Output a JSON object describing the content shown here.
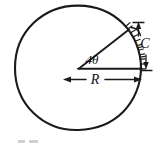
{
  "figure": {
    "kind": "hand-drawn-geometry-diagram",
    "background_color": "#ffffff",
    "ink_color": "#1a1a1a",
    "width": 160,
    "height": 143
  },
  "labels": {
    "angle": "4θ",
    "radius": "R",
    "chord": "C"
  },
  "geometry": {
    "circle": {
      "center_x": 78,
      "center_y": 68,
      "radius": 63
    },
    "angle_degrees": 38,
    "arc_hatch_count": 13
  },
  "annotations": {
    "angle_vertex_note": "4θ marked at circle centre between inclined radius and horizontal radius",
    "radius_dimension_note": "R double-headed arrow spanning centre to right edge of circle",
    "chord_dimension_note": "C vertical dimension with arrows outside circle on the right"
  }
}
